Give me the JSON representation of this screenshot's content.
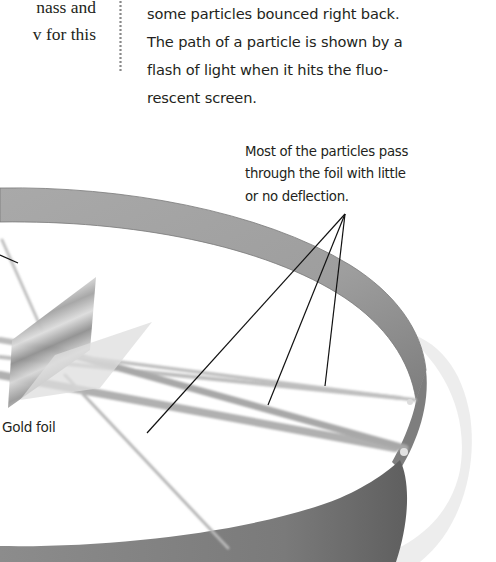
{
  "left_column": {
    "lines": [
      "nass and",
      "v for this"
    ]
  },
  "right_column": {
    "lines": [
      "some particles bounced right back.",
      "The path of a particle is shown by a",
      "flash of light when it hits the fluo-",
      "rescent screen."
    ]
  },
  "diagram": {
    "callout": {
      "lines": [
        "Most of the particles pass",
        "through the foil with little",
        "or no deflection."
      ]
    },
    "labels": {
      "gold_foil": "Gold foil"
    },
    "colors": {
      "ring_band": "#9a9a9a",
      "ring_band_dark": "#6f6f6f",
      "screen_glow": "#ececec",
      "particle_beam": "#b5b5b5",
      "leader_line": "#111111",
      "text": "#231f20"
    }
  }
}
